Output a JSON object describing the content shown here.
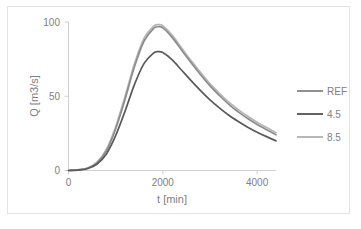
{
  "chart_data": {
    "type": "line",
    "title": "",
    "xlabel": "t [min]",
    "ylabel": "Q [m3/s]",
    "xlim": [
      0,
      4400
    ],
    "ylim": [
      0,
      100
    ],
    "xticks": [
      0,
      2000,
      4000
    ],
    "xtick_labels": [
      "0",
      "2000",
      "4000"
    ],
    "yticks": [
      0,
      50,
      100
    ],
    "ytick_labels": [
      "0",
      "50",
      "100"
    ],
    "grid": false,
    "legend_position": "right",
    "x": [
      0,
      200,
      400,
      600,
      800,
      1000,
      1200,
      1400,
      1600,
      1800,
      1900,
      2000,
      2200,
      2400,
      2600,
      2800,
      3000,
      3200,
      3400,
      3600,
      3800,
      4000,
      4200,
      4400
    ],
    "series": [
      {
        "name": "REF",
        "color": "#8c8c8c",
        "values": [
          0,
          0.4,
          1.5,
          5.0,
          13.0,
          28.0,
          48.0,
          70.0,
          87.0,
          95.5,
          96.8,
          96.0,
          89.5,
          81.0,
          72.5,
          64.5,
          57.0,
          50.5,
          44.5,
          39.5,
          35.0,
          31.0,
          27.5,
          24.0
        ]
      },
      {
        "name": "4.5",
        "color": "#5a5a5a",
        "values": [
          0,
          0.3,
          1.2,
          4.2,
          11.0,
          23.5,
          40.0,
          58.0,
          72.0,
          79.0,
          80.0,
          79.4,
          74.5,
          67.5,
          60.5,
          53.8,
          47.6,
          42.2,
          37.2,
          33.0,
          29.2,
          25.8,
          22.8,
          20.0
        ]
      },
      {
        "name": "8.5",
        "color": "#b5b5b5",
        "values": [
          0,
          0.45,
          1.7,
          5.5,
          14.0,
          29.5,
          50.0,
          72.0,
          89.0,
          97.0,
          98.2,
          97.5,
          91.0,
          82.5,
          74.0,
          66.0,
          58.5,
          52.0,
          46.0,
          41.0,
          36.5,
          32.5,
          29.0,
          25.5
        ]
      }
    ],
    "legend_entries": [
      {
        "label": "REF",
        "color": "#8c8c8c"
      },
      {
        "label": "4.5",
        "color": "#5a5a5a"
      },
      {
        "label": "8.5",
        "color": "#b5b5b5"
      }
    ]
  }
}
